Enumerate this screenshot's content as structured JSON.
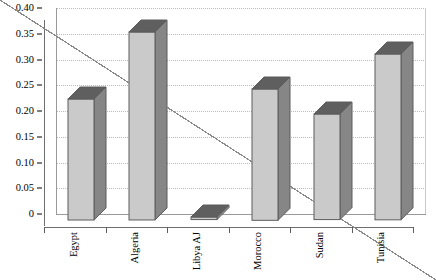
{
  "chart_data": {
    "type": "bar",
    "title": "",
    "subtitle": "",
    "xlabel": "",
    "ylabel": "",
    "categories": [
      "Egypt",
      "Algeria",
      "Libya AJ",
      "Morocco",
      "Sudan",
      "Tunisia"
    ],
    "values": [
      0.235,
      0.365,
      0.005,
      0.255,
      0.205,
      0.322
    ],
    "series": [
      {
        "name": "",
        "values": [
          0.235,
          0.365,
          0.005,
          0.255,
          0.205,
          0.322
        ]
      }
    ],
    "ylim": [
      0,
      0.4
    ],
    "ytick_labels": [
      "0.40",
      "0.35",
      "0.30",
      "0.25",
      "0.20",
      "0.15",
      "0.10",
      "0.05",
      "0"
    ],
    "ytick_values": [
      0.4,
      0.35,
      0.3,
      0.25,
      0.2,
      0.15,
      0.1,
      0.05,
      0
    ],
    "ytick_step": 0.05,
    "grid": true,
    "grid_axis": "y",
    "grid_style": "dotted",
    "legend": false,
    "legend_position": "none",
    "style": "3d-column",
    "colors": {
      "bar_face": "#cacaca",
      "bar_top": "#5f5f5f",
      "bar_side": "#868686",
      "bar_outline": "#5d5d5d",
      "gridline": "#bcbcbc",
      "axis": "#6e6e6e",
      "background": "#ffffff",
      "text": "#000000"
    }
  }
}
